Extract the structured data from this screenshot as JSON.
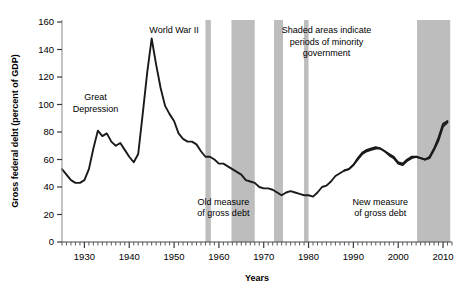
{
  "chart_data": {
    "type": "line",
    "title": "",
    "xlabel": "Years",
    "ylabel": "Gross federal debt (percent of GDP)",
    "xlim": [
      1925,
      2012
    ],
    "ylim": [
      0,
      160
    ],
    "ytick_labels": [
      "0",
      "20",
      "40",
      "60",
      "80",
      "100",
      "120",
      "140",
      "160"
    ],
    "ytick_values": [
      0,
      20,
      40,
      60,
      80,
      100,
      120,
      140,
      160
    ],
    "xtick_labels": [
      "1930",
      "1940",
      "1950",
      "1960",
      "1970",
      "1980",
      "1990",
      "2000",
      "2010"
    ],
    "xtick_values": [
      1930,
      1940,
      1950,
      1960,
      1970,
      1980,
      1990,
      2000,
      2010
    ],
    "minor_tick_interval": 1,
    "grid": false,
    "legend": "none",
    "line_color": "#1a1a1a",
    "shade_color": "#bdbdbd",
    "axis_color": "#808080",
    "series": [
      {
        "name": "Old measure of gross debt",
        "x": [
          1925,
          1926,
          1927,
          1928,
          1929,
          1930,
          1931,
          1932,
          1933,
          1934,
          1935,
          1936,
          1937,
          1938,
          1939,
          1940,
          1941,
          1942,
          1943,
          1944,
          1945,
          1946,
          1947,
          1948,
          1949,
          1950,
          1951,
          1952,
          1953,
          1954,
          1955,
          1956,
          1957,
          1958,
          1959,
          1960,
          1961,
          1962,
          1963,
          1964,
          1965,
          1966,
          1967,
          1968,
          1969,
          1970,
          1971,
          1972,
          1973,
          1974,
          1975,
          1976,
          1977,
          1978,
          1979,
          1980,
          1981,
          1982,
          1983,
          1984,
          1985,
          1986,
          1987,
          1988,
          1989,
          1990,
          1991,
          1992,
          1993,
          1994,
          1995,
          1996,
          1997,
          1998,
          1999,
          2000,
          2001,
          2002,
          2003
        ],
        "values": [
          53,
          49,
          45,
          43,
          43,
          45,
          53,
          68,
          81,
          77,
          79,
          73,
          70,
          72,
          67,
          62,
          58,
          64,
          93,
          123,
          148,
          129,
          112,
          99,
          93,
          88,
          79,
          75,
          73,
          73,
          71,
          66,
          62,
          62,
          60,
          57,
          57,
          55,
          53,
          51,
          49,
          45,
          44,
          43,
          40,
          39,
          39,
          38,
          36,
          34,
          36,
          37,
          36,
          35,
          34,
          34,
          33,
          36,
          40,
          41,
          44,
          48,
          50,
          52,
          53,
          56,
          60,
          64,
          66,
          67,
          68,
          68,
          66,
          64,
          62,
          58,
          57,
          60,
          62
        ]
      },
      {
        "name": "New measure of gross debt",
        "x": [
          1988,
          1989,
          1990,
          1991,
          1992,
          1993,
          1994,
          1995,
          1996,
          1997,
          1998,
          1999,
          2000,
          2001,
          2002,
          2003,
          2004,
          2005,
          2006,
          2007,
          2008,
          2009,
          2010,
          2011
        ],
        "values": [
          52,
          53,
          56,
          61,
          65,
          67,
          68,
          69,
          68,
          66,
          63,
          61,
          57,
          56,
          59,
          61,
          62,
          61,
          60,
          62,
          68,
          76,
          86,
          88
        ]
      },
      {
        "name": "Old measure continued",
        "x": [
          2003,
          2004,
          2005,
          2006,
          2007,
          2008,
          2009,
          2010,
          2011
        ],
        "values": [
          62,
          62,
          61,
          60,
          61,
          67,
          74,
          84,
          87
        ]
      }
    ],
    "shaded_bands": [
      {
        "start": 1957.0,
        "end": 1958.2
      },
      {
        "start": 1962.8,
        "end": 1968.0
      },
      {
        "start": 1972.3,
        "end": 1974.3
      },
      {
        "start": 1979.0,
        "end": 1980.0
      },
      {
        "start": 2004.2,
        "end": 2011.6
      }
    ],
    "annotations": [
      {
        "id": "great-depression",
        "text_lines": [
          "Great",
          "Depression"
        ],
        "x": 1932.5,
        "y": 103
      },
      {
        "id": "world-war-ii",
        "text_lines": [
          "World War II"
        ],
        "x": 1950.0,
        "y": 152
      },
      {
        "id": "shaded-areas-note",
        "text_lines": [
          "Shaded areas indicate",
          "periods of minority",
          "government"
        ],
        "x": 1984.0,
        "y": 152
      },
      {
        "id": "old-measure",
        "text_lines": [
          "Old measure",
          "of gross debt"
        ],
        "x": 1961.0,
        "y": 27
      },
      {
        "id": "new-measure",
        "text_lines": [
          "New measure",
          "of gross debt"
        ],
        "x": 1996.0,
        "y": 27
      }
    ]
  }
}
